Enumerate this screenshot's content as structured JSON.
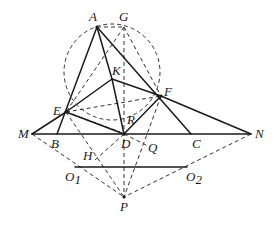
{
  "diagram": {
    "type": "geometry-figure",
    "colors": {
      "stroke": "#1a1a1a",
      "background": "#ffffff"
    },
    "circle": {
      "cx": 112,
      "cy": 72,
      "r": 48,
      "style": "dashed"
    },
    "points": {
      "A": {
        "label": "A",
        "x": 97,
        "y": 27
      },
      "G": {
        "label": "G",
        "x": 124,
        "y": 27
      },
      "K": {
        "label": "K",
        "x": 112,
        "y": 79
      },
      "E": {
        "label": "E",
        "x": 66,
        "y": 112
      },
      "F": {
        "label": "F",
        "x": 161,
        "y": 96
      },
      "R": {
        "label": "R",
        "x": 124,
        "y": 112
      },
      "M": {
        "label": "M",
        "x": 32,
        "y": 134
      },
      "B": {
        "label": "B",
        "x": 57,
        "y": 134
      },
      "D": {
        "label": "D",
        "x": 124,
        "y": 134
      },
      "C": {
        "label": "C",
        "x": 191,
        "y": 134
      },
      "N": {
        "label": "N",
        "x": 251,
        "y": 134
      },
      "Q": {
        "label": "Q",
        "x": 146,
        "y": 140
      },
      "H": {
        "label": "H",
        "x": 97,
        "y": 158
      },
      "O1": {
        "label": "O",
        "sub": "1",
        "x": 75,
        "y": 167
      },
      "O2": {
        "label": "O",
        "sub": "2",
        "x": 187,
        "y": 167
      },
      "P": {
        "label": "P",
        "x": 124,
        "y": 197
      }
    },
    "solid_segments": [
      [
        "A",
        "B"
      ],
      [
        "A",
        "C"
      ],
      [
        "A",
        "K"
      ],
      [
        "K",
        "D"
      ],
      [
        "K",
        "F"
      ],
      [
        "E",
        "K"
      ],
      [
        "E",
        "F"
      ],
      [
        "E",
        "D"
      ],
      [
        "D",
        "F"
      ],
      [
        "F",
        "N"
      ],
      [
        "M",
        "N"
      ],
      [
        "M",
        "E"
      ],
      [
        "O1",
        "O2"
      ]
    ],
    "dashed_segments": [
      [
        "A",
        "G"
      ],
      [
        "G",
        "E"
      ],
      [
        "G",
        "D"
      ],
      [
        "G",
        "F"
      ],
      [
        "E",
        "R"
      ],
      [
        "E",
        "P"
      ],
      [
        "D",
        "P"
      ],
      [
        "F",
        "P"
      ],
      [
        "M",
        "P"
      ],
      [
        "N",
        "P"
      ],
      [
        "D",
        "H"
      ],
      [
        "F",
        "Q"
      ]
    ]
  }
}
